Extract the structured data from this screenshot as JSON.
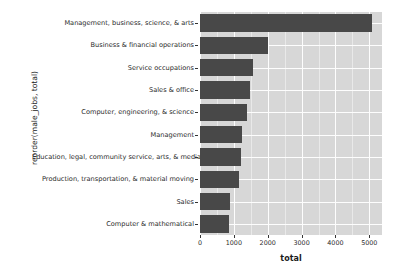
{
  "chart_data": {
    "type": "bar",
    "orientation": "horizontal",
    "title": "",
    "xlabel": "total",
    "ylabel": "reorder(male_jobs, total)",
    "xlim": [
      0,
      5375
    ],
    "xticks": [
      0,
      1000,
      2000,
      3000,
      4000,
      5000
    ],
    "xticklabels": [
      "0",
      "1000",
      "2000",
      "3000",
      "4000",
      "5000"
    ],
    "grid": true,
    "legend": "none",
    "bar_color": "#484848",
    "panel_background": "#d7d7d7",
    "gridline_color": "#ffffff",
    "categories": [
      "Management, business, science, & arts",
      "Business & financial operations",
      "Service occupations",
      "Sales & office",
      "Computer, engineering, & science",
      "Management",
      "Education, legal, community service, arts, & media",
      "Production, transportation, & material moving",
      "Sales",
      "Computer & mathematical"
    ],
    "values": [
      5090,
      2010,
      1570,
      1480,
      1400,
      1250,
      1210,
      1160,
      880,
      870
    ]
  },
  "axes": {
    "y_title": "reorder(male_jobs, total)",
    "x_title": "total"
  }
}
